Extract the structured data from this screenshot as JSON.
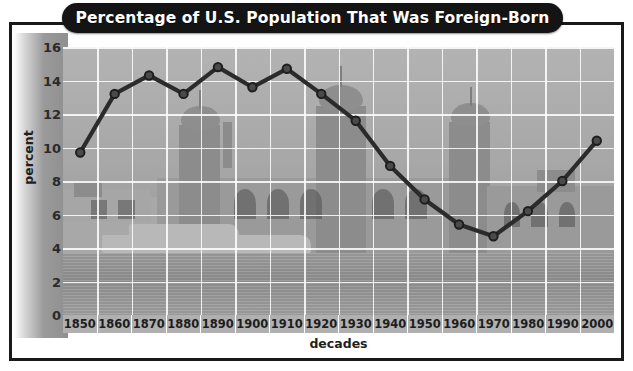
{
  "title": "Percentage of U.S. Population That Was Foreign-Born",
  "axis": {
    "y_title": "percent",
    "x_title": "decades"
  },
  "chart_data": {
    "type": "line",
    "title": "Percentage of U.S. Population That Was Foreign-Born",
    "xlabel": "decades",
    "ylabel": "percent",
    "ylim": [
      0,
      16
    ],
    "ytick_step": 2,
    "yticks": [
      16,
      14,
      12,
      10,
      8,
      6,
      4,
      2,
      0
    ],
    "grid": true,
    "legend": "none",
    "background_image": "faded grayscale photograph of Ellis Island immigration station with ferry boat and harbor water",
    "categories": [
      "1850",
      "1860",
      "1870",
      "1880",
      "1890",
      "1900",
      "1910",
      "1920",
      "1930",
      "1940",
      "1950",
      "1960",
      "1970",
      "1980",
      "1990",
      "2000"
    ],
    "values": [
      9.7,
      13.2,
      14.3,
      13.2,
      14.8,
      13.6,
      14.7,
      13.2,
      11.6,
      8.9,
      6.9,
      5.4,
      4.7,
      6.2,
      8.0,
      10.4
    ],
    "series": [
      {
        "name": "percent foreign-born",
        "values": [
          9.7,
          13.2,
          14.3,
          13.2,
          14.8,
          13.6,
          14.7,
          13.2,
          11.6,
          8.9,
          6.9,
          5.4,
          4.7,
          6.2,
          8.0,
          10.4
        ],
        "color": "#2b2b2b",
        "marker": "circle"
      }
    ]
  },
  "colors": {
    "frame": "#1a1a1a",
    "title_pill": "#141414",
    "title_text": "#ffffff",
    "line": "#2b2b2b",
    "gridline": "#ffffff",
    "plot_bg": "#a8a8a8"
  }
}
